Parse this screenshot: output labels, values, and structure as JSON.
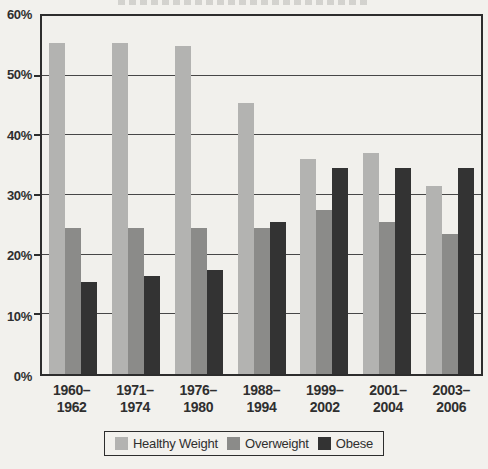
{
  "page": {
    "background": "#f2f1ed",
    "plot_background": "#f1f0ec",
    "border_color": "#2d2d2d",
    "gridline_color": "#474747",
    "text_color": "#2f2f2f"
  },
  "chart_data": {
    "type": "bar",
    "title": "",
    "xlabel": "",
    "ylabel": "",
    "ylim": [
      0,
      60
    ],
    "grid": true,
    "legend_position": "bottom",
    "y_ticks": [
      "60%",
      "50%",
      "40%",
      "30%",
      "20%",
      "10%",
      "0%"
    ],
    "categories": [
      {
        "line1": "1960–",
        "line2": "1962"
      },
      {
        "line1": "1971–",
        "line2": "1974"
      },
      {
        "line1": "1976–",
        "line2": "1980"
      },
      {
        "line1": "1988–",
        "line2": "1994"
      },
      {
        "line1": "1999–",
        "line2": "2002"
      },
      {
        "line1": "2001–",
        "line2": "2004"
      },
      {
        "line1": "2003–",
        "line2": "2006"
      }
    ],
    "series": [
      {
        "name": "Healthy Weight",
        "color": "#b3b3b1",
        "values": [
          55.5,
          55.5,
          55.0,
          45.5,
          36.0,
          37.0,
          31.5
        ]
      },
      {
        "name": "Overweight",
        "color": "#8b8b89",
        "values": [
          24.5,
          24.5,
          24.5,
          24.5,
          27.5,
          25.5,
          23.5
        ]
      },
      {
        "name": "Obese",
        "color": "#333333",
        "values": [
          15.5,
          16.5,
          17.5,
          25.5,
          34.5,
          34.5,
          34.5
        ]
      }
    ]
  }
}
